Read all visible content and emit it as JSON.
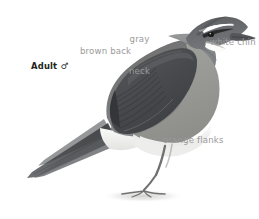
{
  "plate": {
    "background_color": "#ffffff",
    "subject": "bird-illustration",
    "caption": {
      "text": "Adult ♂",
      "color": "#231f20",
      "bold": true
    },
    "label_color": "#9a9a9a",
    "labels": [
      {
        "id": "gray-neck",
        "line1": "gray",
        "line2": "neck",
        "text": "gray neck"
      },
      {
        "id": "brown-back",
        "line1": "brown back",
        "line2": "",
        "text": "brown back"
      },
      {
        "id": "white-chin",
        "line1": "white chin",
        "line2": "",
        "text": "white chin"
      },
      {
        "id": "orange-flanks",
        "line1": "orange flanks",
        "line2": "",
        "text": "orange flanks"
      }
    ],
    "palette": {
      "crown_dark": "#57595a",
      "back_brown": "#6e6f6d",
      "wing_dark": "#4a4c4d",
      "wing_darkest": "#3a3c3d",
      "neck_gray": "#8d8f8f",
      "flank_gray": "#9c9c99",
      "belly_white": "#f2f2f0",
      "chin_white": "#fbfbfa",
      "supercilium": "#ffffff",
      "bill_dark": "#55565a",
      "eye_black": "#1d1d1d",
      "leg_gray": "#7d7e7c",
      "shadow_gray": "#d8d8d6",
      "tail_dark": "#45474a"
    }
  }
}
